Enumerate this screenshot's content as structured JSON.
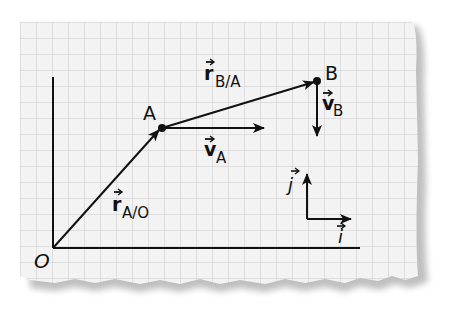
{
  "diagram": {
    "kind": "relative position and velocity vectors on graph paper",
    "points": {
      "origin": {
        "label": "O"
      },
      "A": {
        "label": "A"
      },
      "B": {
        "label": "B"
      }
    },
    "vectors": {
      "r_AO": {
        "symbol": "r",
        "subscript": "A/O"
      },
      "r_BA": {
        "symbol": "r",
        "subscript": "B/A"
      },
      "v_A": {
        "symbol": "v",
        "subscript": "A"
      },
      "v_B": {
        "symbol": "v",
        "subscript": "B"
      }
    },
    "unit_vectors": {
      "i": {
        "label": "i"
      },
      "j": {
        "label": "j"
      }
    },
    "colors": {
      "paper": "#f3f3f3",
      "grid": "#c8c8c8",
      "ink": "#111111",
      "shadow": "#8a8a8a"
    }
  }
}
